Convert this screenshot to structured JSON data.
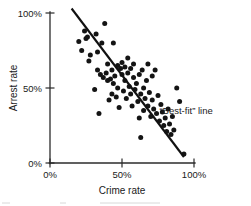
{
  "chart_data": {
    "type": "scatter",
    "title": "",
    "xlabel": "Crime rate",
    "ylabel": "Arrest rate",
    "xlim": [
      0,
      100
    ],
    "ylim": [
      0,
      100
    ],
    "xticks": [
      0,
      50,
      100
    ],
    "yticks": [
      0,
      50,
      100
    ],
    "xticklabels": [
      "0%",
      "50%",
      "100%"
    ],
    "yticklabels": [
      "0%",
      "50%",
      "100%"
    ],
    "grid": false,
    "legend": "none",
    "annotations": [
      {
        "name": "best-fit-line-label",
        "text": "“Best-fit” line",
        "x": 76,
        "y": 33
      }
    ],
    "series": [
      {
        "name": "Cities",
        "marker": "filled-circle",
        "color": "#141414",
        "points": [
          [
            20,
            81
          ],
          [
            22,
            75
          ],
          [
            24,
            88
          ],
          [
            25,
            83
          ],
          [
            26,
            84
          ],
          [
            27,
            68
          ],
          [
            28,
            72
          ],
          [
            31,
            49
          ],
          [
            32,
            86
          ],
          [
            33,
            74
          ],
          [
            33,
            62
          ],
          [
            34,
            33
          ],
          [
            35,
            59
          ],
          [
            36,
            80
          ],
          [
            37,
            57
          ],
          [
            38,
            93
          ],
          [
            39,
            60
          ],
          [
            40,
            55
          ],
          [
            40,
            66
          ],
          [
            41,
            42
          ],
          [
            42,
            56
          ],
          [
            43,
            62
          ],
          [
            43,
            46
          ],
          [
            44,
            80
          ],
          [
            44,
            53
          ],
          [
            45,
            58
          ],
          [
            46,
            44
          ],
          [
            47,
            65
          ],
          [
            47,
            50
          ],
          [
            48,
            37
          ],
          [
            49,
            63
          ],
          [
            50,
            67
          ],
          [
            50,
            59
          ],
          [
            51,
            48
          ],
          [
            52,
            64
          ],
          [
            52,
            55
          ],
          [
            53,
            43
          ],
          [
            54,
            70
          ],
          [
            54,
            60
          ],
          [
            55,
            51
          ],
          [
            56,
            63
          ],
          [
            56,
            46
          ],
          [
            57,
            38
          ],
          [
            58,
            57
          ],
          [
            58,
            66
          ],
          [
            59,
            49
          ],
          [
            60,
            53
          ],
          [
            61,
            41
          ],
          [
            62,
            59
          ],
          [
            62,
            30
          ],
          [
            63,
            46
          ],
          [
            63,
            17
          ],
          [
            64,
            62
          ],
          [
            65,
            50
          ],
          [
            65,
            35
          ],
          [
            66,
            43
          ],
          [
            67,
            55
          ],
          [
            68,
            38
          ],
          [
            68,
            66
          ],
          [
            69,
            47
          ],
          [
            70,
            31
          ],
          [
            71,
            58
          ],
          [
            71,
            42
          ],
          [
            72,
            36
          ],
          [
            73,
            62
          ],
          [
            74,
            33
          ],
          [
            75,
            45
          ],
          [
            76,
            28
          ],
          [
            77,
            39
          ],
          [
            78,
            34
          ],
          [
            79,
            25
          ],
          [
            80,
            30
          ],
          [
            81,
            21
          ],
          [
            82,
            36
          ],
          [
            83,
            26
          ],
          [
            84,
            19
          ],
          [
            85,
            31
          ],
          [
            86,
            22
          ],
          [
            88,
            50
          ],
          [
            90,
            41
          ],
          [
            93,
            6
          ]
        ]
      }
    ],
    "fit_line": {
      "name": "Best-fit line",
      "color": "#111111",
      "x_start": 15,
      "y_start": 103,
      "x_end": 93,
      "y_end": 4
    }
  }
}
